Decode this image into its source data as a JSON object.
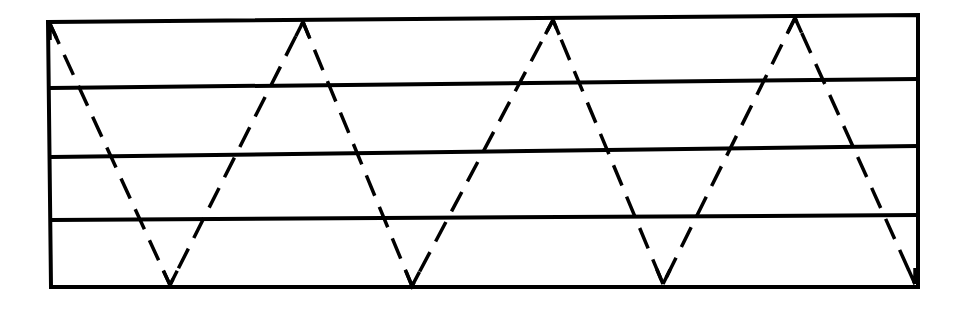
{
  "diagram": {
    "type": "layered-rectangle-with-zigzag-ray",
    "colors": {
      "background": "#ffffff",
      "stroke": "#000000"
    },
    "frame": {
      "top_left": [
        48,
        22
      ],
      "top_right": [
        918,
        15
      ],
      "bottom_right": [
        918,
        287
      ],
      "bottom_left": [
        51,
        287
      ]
    },
    "layer_lines": [
      {
        "id": "line-1",
        "from": [
          50,
          88
        ],
        "to": [
          918,
          79
        ]
      },
      {
        "id": "line-2",
        "from": [
          51,
          157
        ],
        "to": [
          918,
          146
        ]
      },
      {
        "id": "line-3",
        "from": [
          52,
          220
        ],
        "to": [
          918,
          215
        ]
      }
    ],
    "layer_count": 4,
    "ray": {
      "style": "dashed",
      "vertices": [
        [
          50,
          24
        ],
        [
          170,
          285
        ],
        [
          303,
          22
        ],
        [
          412,
          286
        ],
        [
          553,
          20
        ],
        [
          663,
          284
        ],
        [
          795,
          18
        ],
        [
          915,
          284
        ]
      ],
      "arrowheads": [
        {
          "at": [
            50,
            24
          ],
          "direction": "up"
        },
        {
          "at": [
            170,
            285
          ],
          "direction": "down"
        },
        {
          "at": [
            303,
            22
          ],
          "direction": "up"
        },
        {
          "at": [
            412,
            286
          ],
          "direction": "down"
        },
        {
          "at": [
            553,
            20
          ],
          "direction": "up"
        },
        {
          "at": [
            663,
            284
          ],
          "direction": "down"
        },
        {
          "at": [
            795,
            18
          ],
          "direction": "up"
        },
        {
          "at": [
            915,
            284
          ],
          "direction": "down"
        }
      ]
    }
  }
}
